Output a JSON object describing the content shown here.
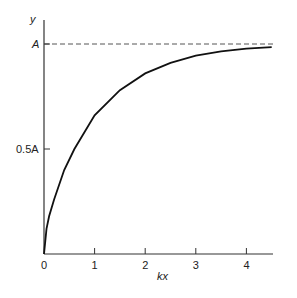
{
  "chart_data": {
    "type": "line",
    "title": "",
    "xlabel": "kx",
    "ylabel": "y",
    "xlim": [
      0,
      4.5
    ],
    "ylim": [
      0,
      1.1
    ],
    "x_ticks": [
      0,
      1,
      2,
      3,
      4
    ],
    "x_tick_labels": [
      "0",
      "1",
      "2",
      "3",
      "4"
    ],
    "y_ticks": [
      0.5,
      1.0
    ],
    "y_tick_labels": [
      "0.5A",
      "A"
    ],
    "grid": false,
    "legend": null,
    "series": [
      {
        "name": "y(kx)",
        "style": "solid",
        "x": [
          0,
          0.05,
          0.1,
          0.2,
          0.4,
          0.6,
          1.0,
          1.5,
          2.0,
          2.5,
          3.0,
          3.5,
          4.0,
          4.5
        ],
        "values": [
          0,
          0.12,
          0.18,
          0.26,
          0.4,
          0.5,
          0.66,
          0.78,
          0.86,
          0.91,
          0.945,
          0.965,
          0.978,
          0.985
        ]
      },
      {
        "name": "asymptote A",
        "style": "dashed",
        "x": [
          0,
          4.5
        ],
        "values": [
          1.0,
          1.0
        ]
      }
    ],
    "annotations": [
      "A",
      "0.5A"
    ]
  },
  "labels": {
    "y_axis": "y",
    "x_axis": "kx",
    "y_tick_A": "A",
    "y_tick_half": "0.5A",
    "x_ticks": [
      "0",
      "1",
      "2",
      "3",
      "4"
    ]
  }
}
